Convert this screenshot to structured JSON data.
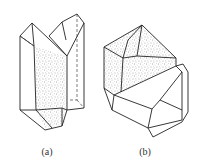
{
  "figure": {
    "type": "crystal line drawings",
    "panels": [
      {
        "id": "a",
        "caption": "(a)",
        "description": "twinned prismatic crystal with stippled face"
      },
      {
        "id": "b",
        "caption": "(b)",
        "description": "polyhedral crystal with stippled upper faces"
      }
    ],
    "colors": {
      "line": "#222222",
      "stipple": "#555555",
      "background": "#ffffff"
    }
  }
}
